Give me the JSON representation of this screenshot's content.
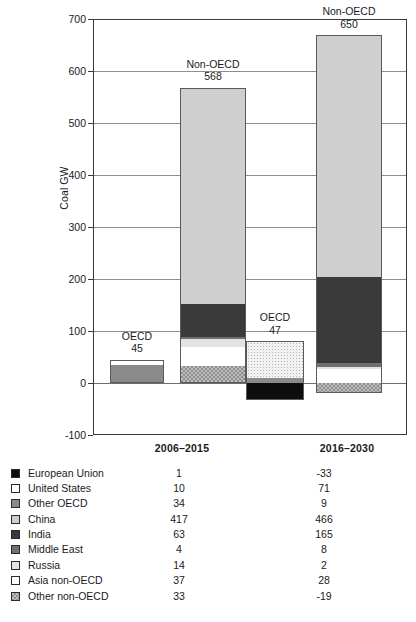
{
  "chart_data": {
    "type": "bar",
    "stacked": true,
    "title": "",
    "xlabel": "",
    "ylabel": "Coal GW",
    "ylim": [
      -100,
      700
    ],
    "ytick_step": 100,
    "yticks": [
      "700",
      "600",
      "500",
      "400",
      "300",
      "200",
      "100",
      "0",
      "-100"
    ],
    "grid": true,
    "legend_position": "below-plot-table",
    "categories": [
      "2006–2015",
      "2016–2030"
    ],
    "groups": [
      {
        "name": "OECD",
        "period": "2006–2015",
        "total_label": "OECD",
        "total_value": "45",
        "total": 45,
        "segments": [
          {
            "name": "Other OECD",
            "value": 34,
            "fill": "f-ooecd"
          },
          {
            "name": "United States",
            "value": 10,
            "fill": "f-us"
          },
          {
            "name": "European Union",
            "value": 1,
            "fill": "f-eu"
          }
        ]
      },
      {
        "name": "Non-OECD",
        "period": "2006–2015",
        "total_label": "Non-OECD",
        "total_value": "568",
        "total": 568,
        "segments": [
          {
            "name": "Other non-OECD",
            "value": 33,
            "fill": "f-onoecd"
          },
          {
            "name": "Asia non-OECD",
            "value": 37,
            "fill": "f-asia"
          },
          {
            "name": "Russia",
            "value": 14,
            "fill": "f-russia"
          },
          {
            "name": "Middle East",
            "value": 4,
            "fill": "f-me"
          },
          {
            "name": "India",
            "value": 63,
            "fill": "f-india"
          },
          {
            "name": "China",
            "value": 417,
            "fill": "f-china"
          }
        ]
      },
      {
        "name": "OECD",
        "period": "2016–2030",
        "total_label": "OECD",
        "total_value": "47",
        "total": 47,
        "segments": [
          {
            "name": "Other OECD",
            "value": 9,
            "fill": "f-ooecd"
          },
          {
            "name": "United States",
            "value": 71,
            "fill": "f-us-dot"
          },
          {
            "name": "European Union",
            "value": -33,
            "fill": "f-eu"
          }
        ]
      },
      {
        "name": "Non-OECD",
        "period": "2016–2030",
        "total_label": "Non-OECD",
        "total_value": "650",
        "total": 650,
        "segments": [
          {
            "name": "Other non-OECD",
            "value": -19,
            "fill": "f-onoecd"
          },
          {
            "name": "Asia non-OECD",
            "value": 28,
            "fill": "f-asia"
          },
          {
            "name": "Russia",
            "value": 2,
            "fill": "f-russia"
          },
          {
            "name": "Middle East",
            "value": 8,
            "fill": "f-me"
          },
          {
            "name": "India",
            "value": 165,
            "fill": "f-india"
          },
          {
            "name": "China",
            "value": 466,
            "fill": "f-china"
          }
        ]
      }
    ],
    "series": [
      {
        "name": "European Union",
        "swatch": "f-eu",
        "values": [
          1,
          -33
        ],
        "labels": [
          "1",
          "-33"
        ]
      },
      {
        "name": "United States",
        "swatch": "f-us",
        "values": [
          10,
          71
        ],
        "labels": [
          "10",
          "71"
        ]
      },
      {
        "name": "Other OECD",
        "swatch": "f-ooecd",
        "values": [
          34,
          9
        ],
        "labels": [
          "34",
          "9"
        ]
      },
      {
        "name": "China",
        "swatch": "f-china",
        "values": [
          417,
          466
        ],
        "labels": [
          "417",
          "466"
        ]
      },
      {
        "name": "India",
        "swatch": "f-india",
        "values": [
          63,
          165
        ],
        "labels": [
          "63",
          "165"
        ]
      },
      {
        "name": "Middle East",
        "swatch": "f-me",
        "values": [
          4,
          8
        ],
        "labels": [
          "4",
          "8"
        ]
      },
      {
        "name": "Russia",
        "swatch": "f-russia",
        "values": [
          14,
          2
        ],
        "labels": [
          "14",
          "2"
        ]
      },
      {
        "name": "Asia non-OECD",
        "swatch": "f-asia",
        "values": [
          37,
          28
        ],
        "labels": [
          "37",
          "28"
        ]
      },
      {
        "name": "Other non-OECD",
        "swatch": "f-onoecd",
        "values": [
          33,
          -19
        ],
        "labels": [
          "33",
          "-19"
        ]
      }
    ]
  },
  "axis": {
    "y_title": "Coal GW",
    "y_ticks": [
      "700",
      "600",
      "500",
      "400",
      "300",
      "200",
      "100",
      "0",
      "-100"
    ],
    "x_categories": [
      "2006–2015",
      "2016–2030"
    ]
  },
  "annotations": [
    {
      "label": "OECD",
      "value": "45"
    },
    {
      "label": "Non-OECD",
      "value": "568"
    },
    {
      "label": "OECD",
      "value": "47"
    },
    {
      "label": "Non-OECD",
      "value": "650"
    }
  ],
  "colors": {
    "european_union": "#0d0d0d",
    "united_states": "#ffffff",
    "other_oecd": "#8a8a8a",
    "china": "#cfcfcf",
    "india": "#3a3a3a",
    "middle_east": "#707070",
    "russia": "#e3e3e3",
    "asia_non_oecd": "#ffffff",
    "other_non_oecd": "#bdbdbd",
    "axis": "#3a3a3a",
    "gridline": "#8d8d8d",
    "background": "#ffffff"
  }
}
